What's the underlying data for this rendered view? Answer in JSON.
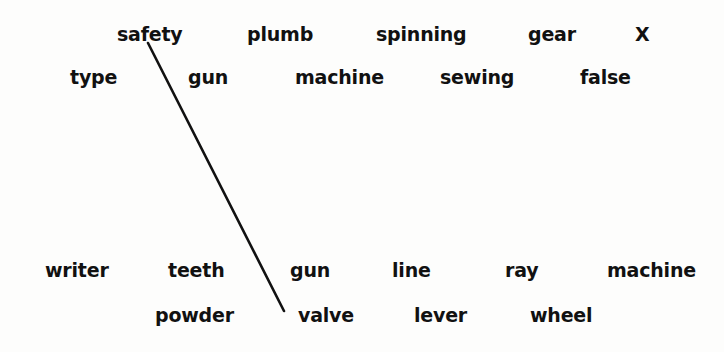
{
  "canvas": {
    "width": 724,
    "height": 352,
    "background_color": "#fdfdfc",
    "ink_color": "#111111"
  },
  "stroke": {
    "name": "diagonal-pen-stroke",
    "color": "#111111",
    "width": 2.6,
    "x1": 148,
    "y1": 43,
    "x2": 284,
    "y2": 311
  },
  "rows": [
    {
      "name": "row-1",
      "baseline_y": 40,
      "words": [
        {
          "text": "safety",
          "x": 117,
          "bold": true
        },
        {
          "text": "plumb",
          "x": 247,
          "bold": true
        },
        {
          "text": "spinning",
          "x": 376,
          "bold": true
        },
        {
          "text": "gear",
          "x": 528,
          "bold": true
        },
        {
          "text": "X",
          "x": 635,
          "bold": true
        }
      ]
    },
    {
      "name": "row-2",
      "baseline_y": 83,
      "words": [
        {
          "text": "type",
          "x": 70,
          "bold": true
        },
        {
          "text": "gun",
          "x": 188,
          "bold": true
        },
        {
          "text": "machine",
          "x": 295,
          "bold": true
        },
        {
          "text": "sewing",
          "x": 440,
          "bold": true
        },
        {
          "text": "false",
          "x": 580,
          "bold": true
        }
      ]
    },
    {
      "name": "row-3",
      "baseline_y": 276,
      "words": [
        {
          "text": "writer",
          "x": 45,
          "bold": true
        },
        {
          "text": "teeth",
          "x": 168,
          "bold": true
        },
        {
          "text": "gun",
          "x": 290,
          "bold": true
        },
        {
          "text": "line",
          "x": 392,
          "bold": true
        },
        {
          "text": "ray",
          "x": 505,
          "bold": true
        },
        {
          "text": "machine",
          "x": 607,
          "bold": true
        }
      ]
    },
    {
      "name": "row-4",
      "baseline_y": 321,
      "words": [
        {
          "text": "powder",
          "x": 155,
          "bold": true
        },
        {
          "text": "valve",
          "x": 298,
          "bold": true
        },
        {
          "text": "lever",
          "x": 414,
          "bold": true
        },
        {
          "text": "wheel",
          "x": 530,
          "bold": true
        }
      ]
    }
  ]
}
